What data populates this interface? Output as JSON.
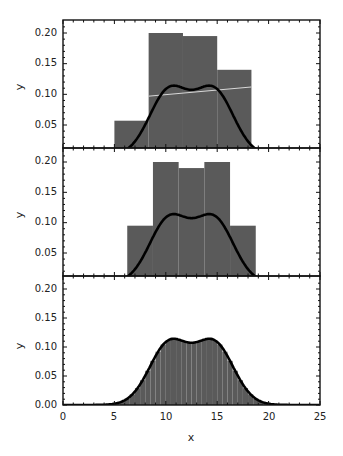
{
  "chart_data": [
    {
      "type": "bar",
      "panel": "top",
      "title": "",
      "xlabel": "",
      "ylabel": "y",
      "xlim": [
        0,
        25
      ],
      "ylim": [
        -0.013,
        0.22
      ],
      "yticks": [
        0.05,
        0.1,
        0.15,
        0.2
      ],
      "ytick_labels": [
        "0.05",
        "0.10",
        "0.15",
        "0.20"
      ],
      "grid": false,
      "bins": [
        {
          "x0": 5.0,
          "x1": 8.33,
          "height": 0.057
        },
        {
          "x0": 8.33,
          "x1": 11.67,
          "height": 0.2
        },
        {
          "x0": 11.67,
          "x1": 15.0,
          "height": 0.195
        },
        {
          "x0": 15.0,
          "x1": 18.33,
          "height": 0.14
        }
      ],
      "annotation_line": {
        "x0": 8.33,
        "y0": 0.097,
        "x1": 18.33,
        "y1": 0.112,
        "color": "#d8d8d8"
      },
      "curve": "bimodal density, peaks ~0.203 at x≈10.5 and x≈14.5, dip ~0.19 at x≈12.5"
    },
    {
      "type": "bar",
      "panel": "middle",
      "title": "",
      "xlabel": "",
      "ylabel": "y",
      "xlim": [
        0,
        25
      ],
      "ylim": [
        -0.013,
        0.22
      ],
      "yticks": [
        0.05,
        0.1,
        0.15,
        0.2
      ],
      "ytick_labels": [
        "0.05",
        "0.10",
        "0.15",
        "0.20"
      ],
      "grid": false,
      "bins": [
        {
          "x0": 6.25,
          "x1": 8.75,
          "height": 0.095
        },
        {
          "x0": 8.75,
          "x1": 11.25,
          "height": 0.2
        },
        {
          "x0": 11.25,
          "x1": 13.75,
          "height": 0.19
        },
        {
          "x0": 13.75,
          "x1": 16.25,
          "height": 0.2
        },
        {
          "x0": 16.25,
          "x1": 18.75,
          "height": 0.095
        }
      ],
      "curve": "bimodal density, peaks ~0.203 at x≈10.5 and x≈14.5, dip ~0.19 at x≈12.5"
    },
    {
      "type": "bar",
      "panel": "bottom",
      "title": "",
      "xlabel": "x",
      "ylabel": "y",
      "xlim": [
        0,
        25
      ],
      "ylim": [
        0,
        0.22
      ],
      "xticks": [
        0,
        5,
        10,
        15,
        20,
        25
      ],
      "xtick_labels": [
        "0",
        "5",
        "10",
        "15",
        "20",
        "25"
      ],
      "yticks": [
        0.0,
        0.05,
        0.1,
        0.15,
        0.2
      ],
      "ytick_labels": [
        "0.00",
        "0.05",
        "0.10",
        "0.15",
        "0.20"
      ],
      "grid": false,
      "bins_note": "fine histogram, bin width 0.5 from 4 to 21, closely following the density curve",
      "curve": "bimodal density, peaks ~0.203 at x≈10.5 and x≈14.5, dip ~0.19 at x≈12.5"
    }
  ],
  "colors": {
    "bar_fill": "#5a5a5a",
    "curve": "#000000",
    "frame": "#111111",
    "background": "#ffffff"
  },
  "labels": {
    "ylabel": "y",
    "xlabel": "x",
    "top_yticks": [
      "0.20",
      "0.15",
      "0.10",
      "0.05"
    ],
    "mid_yticks": [
      "0.20",
      "0.15",
      "0.10",
      "0.05"
    ],
    "bot_yticks": [
      "0.20",
      "0.15",
      "0.10",
      "0.05",
      "0.00"
    ],
    "xticks": [
      "0",
      "5",
      "10",
      "15",
      "20",
      "25"
    ]
  }
}
